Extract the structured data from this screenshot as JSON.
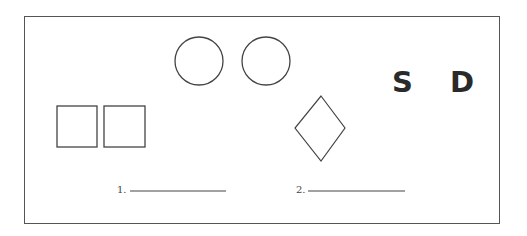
{
  "figure": {
    "frame": {
      "x": 24,
      "y": 16,
      "width": 476,
      "height": 208,
      "stroke": "#555555"
    },
    "stroke_color": "#444444",
    "circles": [
      {
        "cx": 199,
        "cy": 61,
        "r": 24
      },
      {
        "cx": 266,
        "cy": 61,
        "r": 24
      }
    ],
    "squares": [
      {
        "x": 57,
        "y": 106,
        "width": 40,
        "height": 41
      },
      {
        "x": 104,
        "y": 106,
        "width": 41,
        "height": 41
      }
    ],
    "diamond": {
      "top": [
        321,
        96
      ],
      "right": [
        345,
        128
      ],
      "bottom": [
        321,
        161
      ],
      "left": [
        295,
        128
      ]
    },
    "letters": [
      {
        "text": "S",
        "x": 392,
        "y": 68
      },
      {
        "text": "D",
        "x": 450,
        "y": 68
      }
    ],
    "answers": [
      {
        "label": "1.",
        "label_x": 117,
        "label_y": 185,
        "line_x1": 130,
        "line_x2": 226,
        "line_y": 191
      },
      {
        "label": "2.",
        "label_x": 296,
        "label_y": 185,
        "line_x1": 308,
        "line_x2": 405,
        "line_y": 191
      }
    ]
  }
}
